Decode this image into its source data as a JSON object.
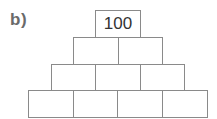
{
  "label": "b)",
  "pyramid": {
    "rows": [
      {
        "cells": [
          "100"
        ]
      },
      {
        "cells": [
          "",
          ""
        ]
      },
      {
        "cells": [
          "",
          "",
          ""
        ]
      },
      {
        "cells": [
          "",
          "",
          "",
          ""
        ]
      }
    ]
  },
  "colors": {
    "line": "#8a8a8a",
    "text": "#333333",
    "label": "#6a6a6a"
  }
}
